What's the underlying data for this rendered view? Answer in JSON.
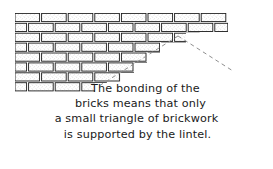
{
  "figure": {
    "colors": {
      "brick_outline": "#1a1a1a",
      "brick_fill": "#ffffff",
      "brick_texture": "#9b9b9b",
      "mortar": "#ffffff",
      "dashed_line": "#8c8c8c",
      "text": "#1a1a1a",
      "background": "#ffffff"
    },
    "caption": {
      "lines": [
        "The bonding of the",
        "bricks means that only",
        "a small triangle of brickwork",
        "is supported by the lintel."
      ],
      "full_text": "The bonding of the bricks means that only a small triangle of brickwork is supported by the lintel."
    },
    "wall": {
      "label": "brick-wall",
      "rows": 8,
      "row_height": 9.9,
      "brick_length": 26,
      "description": "Stretcher-bond brick wall with stepped right edge descending from full width at top to a short run at the bottom",
      "left_edge_x": 15,
      "top_y": 13,
      "bottom_y": 92,
      "row_right_edges": [
        228,
        228,
        186,
        160,
        147,
        134,
        121,
        95
      ],
      "row_offsets": [
        0,
        13,
        0,
        13,
        0,
        13,
        0,
        13
      ]
    },
    "triangle": {
      "label": "load-triangle",
      "style": "dashed",
      "apex": {
        "x": 178,
        "y": 36
      },
      "left_end": {
        "x": 99,
        "y": 86
      },
      "right_end": {
        "x": 233,
        "y": 71
      },
      "meaning": "small triangle of brickwork supported by the lintel"
    }
  }
}
